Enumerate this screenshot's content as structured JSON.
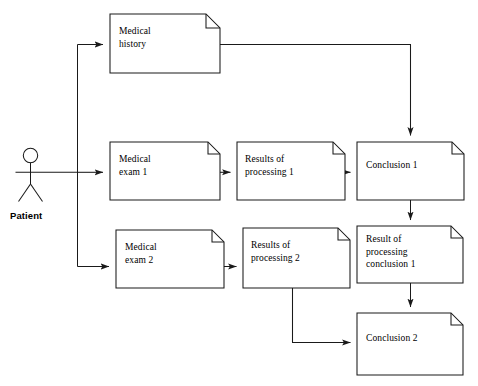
{
  "diagram": {
    "background_color": "#ffffff",
    "stroke_color": "#1a1a1a",
    "text_color": "#000000",
    "actor": {
      "name": "patient-actor",
      "label": "Patient",
      "icon": "stick-figure-actor-icon"
    },
    "nodes": [
      {
        "id": "medical-history",
        "label": "Medical\nhistory",
        "shape": "document",
        "x": 110,
        "y": 14,
        "w": 110,
        "h": 59
      },
      {
        "id": "medical-exam-1",
        "label": "Medical\nexam 1",
        "shape": "document",
        "x": 110,
        "y": 142,
        "w": 110,
        "h": 58
      },
      {
        "id": "results-of-processing-1",
        "label": "Results of\nprocessing 1",
        "shape": "document",
        "x": 237,
        "y": 142,
        "w": 108,
        "h": 58
      },
      {
        "id": "conclusion-1",
        "label": "Conclusion 1",
        "shape": "document",
        "x": 357,
        "y": 142,
        "w": 107,
        "h": 58
      },
      {
        "id": "medical-exam-2",
        "label": "Medical\nexam 2",
        "shape": "document",
        "x": 116,
        "y": 230,
        "w": 108,
        "h": 58
      },
      {
        "id": "results-of-processing-2",
        "label": "Results of\nprocessing 2",
        "shape": "document",
        "x": 243,
        "y": 228,
        "w": 107,
        "h": 60
      },
      {
        "id": "result-of-processing-conclusion-1",
        "label": "Result of\nprocessing\nconclusion 1",
        "shape": "document",
        "x": 357,
        "y": 226,
        "w": 106,
        "h": 57
      },
      {
        "id": "conclusion-2",
        "label": "Conclusion 2",
        "shape": "document",
        "x": 357,
        "y": 313,
        "w": 106,
        "h": 62
      }
    ],
    "edges": [
      {
        "id": "edge-patient-to-trunk",
        "from": "patient-actor",
        "to": "branch-trunk",
        "arrow": false
      },
      {
        "id": "edge-trunk-to-medical-history",
        "from": "branch-trunk",
        "to": "medical-history",
        "arrow": true
      },
      {
        "id": "edge-trunk-to-medical-exam-1",
        "from": "branch-trunk",
        "to": "medical-exam-1",
        "arrow": true
      },
      {
        "id": "edge-trunk-to-medical-exam-2",
        "from": "branch-trunk",
        "to": "medical-exam-2",
        "arrow": true
      },
      {
        "id": "edge-medical-history-to-conclusion-1",
        "from": "medical-history",
        "to": "conclusion-1",
        "arrow": true
      },
      {
        "id": "edge-medical-exam-1-to-results-1",
        "from": "medical-exam-1",
        "to": "results-of-processing-1",
        "arrow": true
      },
      {
        "id": "edge-results-1-to-conclusion-1",
        "from": "results-of-processing-1",
        "to": "conclusion-1",
        "arrow": true
      },
      {
        "id": "edge-medical-exam-2-to-results-2",
        "from": "medical-exam-2",
        "to": "results-of-processing-2",
        "arrow": true
      },
      {
        "id": "edge-conclusion-1-to-result-processing",
        "from": "conclusion-1",
        "to": "result-of-processing-conclusion-1",
        "arrow": true
      },
      {
        "id": "edge-result-processing-to-conclusion-2",
        "from": "result-of-processing-conclusion-1",
        "to": "conclusion-2",
        "arrow": true
      },
      {
        "id": "edge-results-2-to-conclusion-2",
        "from": "results-of-processing-2",
        "to": "conclusion-2",
        "arrow": true
      }
    ]
  }
}
